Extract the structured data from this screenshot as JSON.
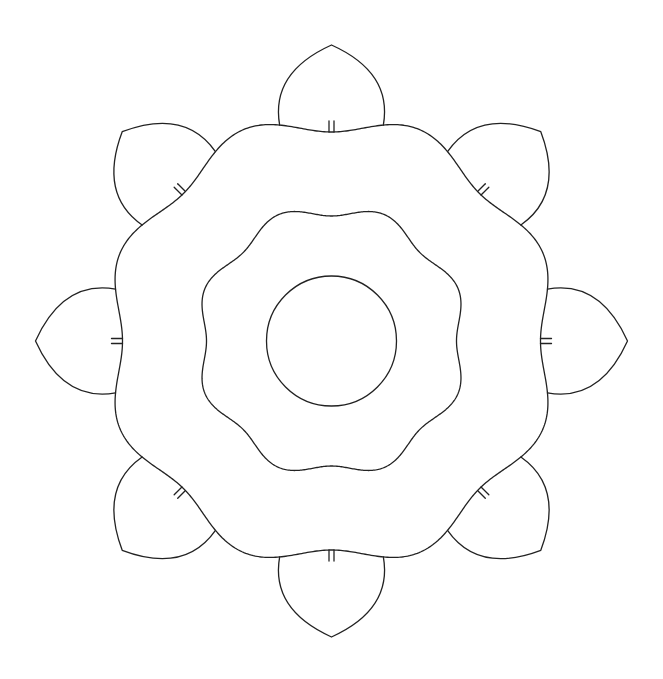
{
  "diagram": {
    "type": "geometric-line-drawing",
    "colors": {
      "background": "#ffffff",
      "stroke": "#222222"
    },
    "stroke_width": 1.3,
    "center": {
      "x": 331.5,
      "y": 341
    },
    "inner_circle": {
      "radius": 65
    },
    "middle_ring": {
      "lobes": 8,
      "base_radius": 131,
      "amplitude": 6,
      "valley_angles_deg": [
        0,
        45,
        90,
        135,
        180,
        225,
        270,
        315
      ]
    },
    "outer_ring": {
      "lobes": 8,
      "base_radius": 219,
      "amplitude": 10,
      "valley_angles_deg": [
        0,
        45,
        90,
        135,
        180,
        225,
        270,
        315
      ]
    },
    "petals": {
      "count": 8,
      "tip_radius": 296,
      "half_width_deg": 13.5,
      "angles_deg": [
        0,
        45,
        90,
        135,
        180,
        225,
        270,
        315
      ],
      "tick_marks": {
        "per_petal": 2,
        "length": 11,
        "spacing": 5
      }
    }
  }
}
